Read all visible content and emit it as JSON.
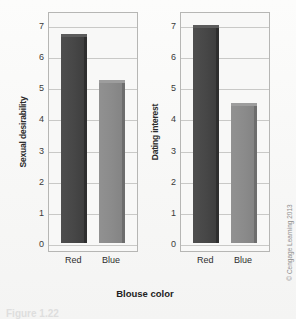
{
  "figure": {
    "xlabel": "Blouse color",
    "credit": "© Cengage Learning 2013",
    "caption": "Figure 1.22"
  },
  "colors": {
    "bar_red": "#474747",
    "bar_blue": "#8b8b8b",
    "plot_border": "#b6b6b4",
    "gridline": "#c9c9c7",
    "background": "#f8f8f7"
  },
  "chart_data": [
    {
      "type": "bar",
      "title": "",
      "xlabel": "Blouse color",
      "ylabel": "Sexual desirability",
      "categories": [
        "Red",
        "Blue"
      ],
      "values": [
        6.7,
        5.25
      ],
      "ylim": [
        0,
        7
      ],
      "yticks": [
        0,
        1,
        2,
        3,
        4,
        5,
        6,
        7
      ],
      "grid": true,
      "legend": "none",
      "series": [
        {
          "name": "Sexual desirability",
          "values": [
            6.7,
            5.25
          ]
        }
      ]
    },
    {
      "type": "bar",
      "title": "",
      "xlabel": "Blouse color",
      "ylabel": "Dating interest",
      "categories": [
        "Red",
        "Blue"
      ],
      "values": [
        7.0,
        4.5
      ],
      "ylim": [
        0,
        7
      ],
      "yticks": [
        0,
        1,
        2,
        3,
        4,
        5,
        6,
        7
      ],
      "grid": true,
      "legend": "none",
      "series": [
        {
          "name": "Dating interest",
          "values": [
            7.0,
            4.5
          ]
        }
      ]
    }
  ]
}
